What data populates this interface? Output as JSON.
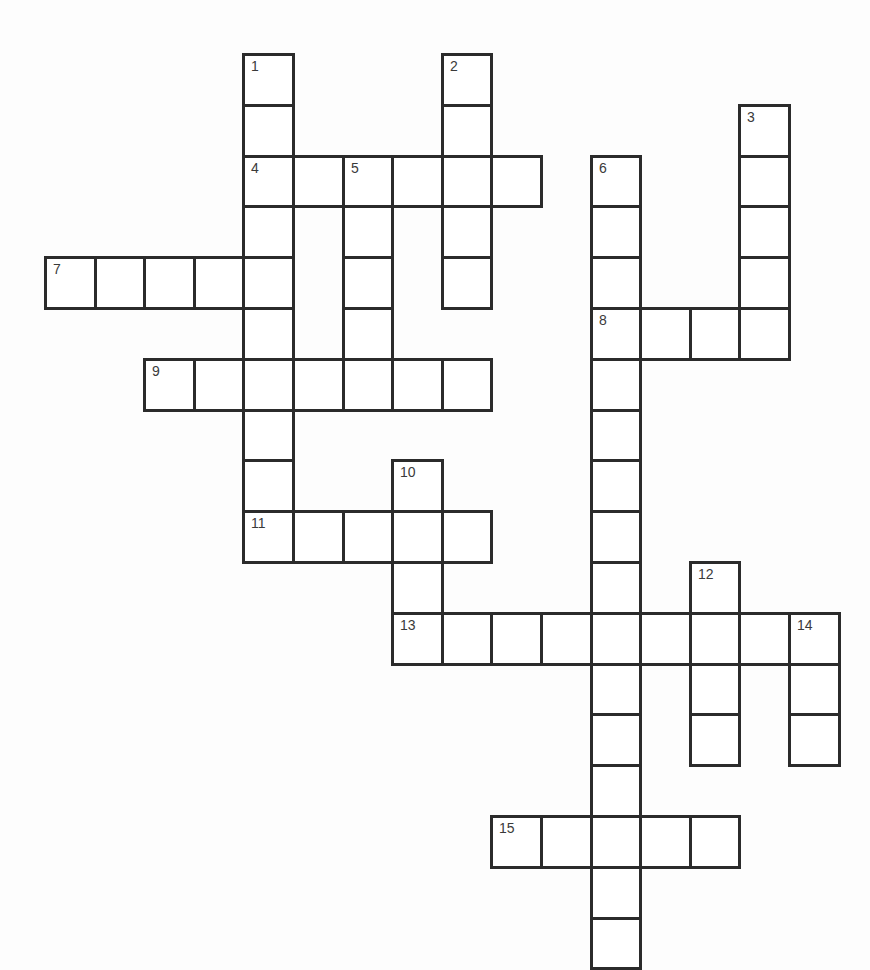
{
  "puzzle": {
    "origin": {
      "x": 44,
      "y": 53
    },
    "cell_w": 49.6,
    "cell_h": 50.8,
    "line_color": "#2b2b2b",
    "entries": [
      {
        "number": "1",
        "direction": "down",
        "row": 0,
        "col": 4,
        "length": 10
      },
      {
        "number": "2",
        "direction": "down",
        "row": 0,
        "col": 8,
        "length": 5
      },
      {
        "number": "3",
        "direction": "down",
        "row": 1,
        "col": 14,
        "length": 5
      },
      {
        "number": "4",
        "direction": "across",
        "row": 2,
        "col": 4,
        "length": 6
      },
      {
        "number": "5",
        "direction": "down",
        "row": 2,
        "col": 6,
        "length": 4
      },
      {
        "number": "6",
        "direction": "down",
        "row": 2,
        "col": 11,
        "length": 16
      },
      {
        "number": "7",
        "direction": "across",
        "row": 4,
        "col": 0,
        "length": 5
      },
      {
        "number": "8",
        "direction": "across",
        "row": 5,
        "col": 11,
        "length": 4
      },
      {
        "number": "9",
        "direction": "across",
        "row": 6,
        "col": 2,
        "length": 7
      },
      {
        "number": "10",
        "direction": "down",
        "row": 8,
        "col": 7,
        "length": 4
      },
      {
        "number": "11",
        "direction": "across",
        "row": 9,
        "col": 4,
        "length": 5
      },
      {
        "number": "12",
        "direction": "down",
        "row": 10,
        "col": 13,
        "length": 4
      },
      {
        "number": "13",
        "direction": "across",
        "row": 11,
        "col": 7,
        "length": 9
      },
      {
        "number": "14",
        "direction": "down",
        "row": 11,
        "col": 15,
        "length": 3
      },
      {
        "number": "15",
        "direction": "across",
        "row": 15,
        "col": 9,
        "length": 5
      }
    ]
  }
}
